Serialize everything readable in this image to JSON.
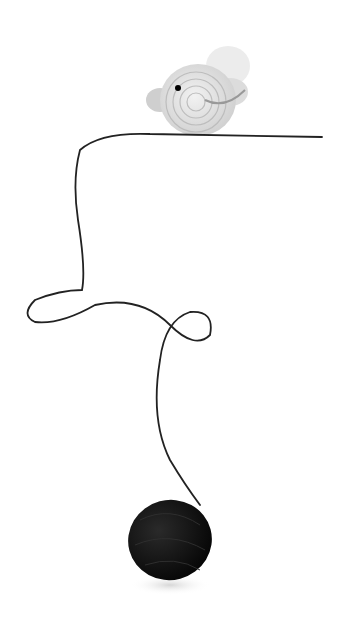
{
  "scene": {
    "description": "Crocheted white mouse resting on a dark thread that loops down to a black ball of yarn on a white background",
    "colors": {
      "background": "#ffffff",
      "mouse_body": "#e6e6e6",
      "mouse_ear": "#d9d9d9",
      "thread": "#222222",
      "yarn_ball": "#111111",
      "eye": "#000000"
    }
  }
}
